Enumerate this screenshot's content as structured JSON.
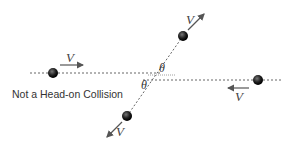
{
  "diagram": {
    "caption": "Not a Head-on Collision",
    "velocity_label": "V",
    "angle_label": "θ",
    "colors": {
      "ball": "#1a1a1a",
      "line": "#666666",
      "arrow": "#555555",
      "text": "#333333"
    },
    "balls": [
      {
        "name": "left-ball",
        "cx": 53,
        "cy": 73
      },
      {
        "name": "right-ball",
        "cx": 258,
        "cy": 80
      },
      {
        "name": "top-ball",
        "cx": 183,
        "cy": 36
      },
      {
        "name": "bottom-ball",
        "cx": 127,
        "cy": 116
      }
    ],
    "labels": {
      "v_left": "V",
      "v_right": "V",
      "v_top": "V",
      "v_bottom": "V",
      "theta_upper": "θ",
      "theta_lower": "θ"
    }
  }
}
